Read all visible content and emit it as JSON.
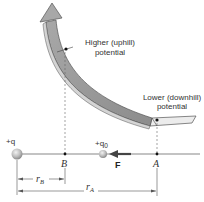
{
  "diagram": {
    "labels": {
      "higher_line1": "Higher (uphill)",
      "higher_line2": "potential",
      "lower_line1": "Lower (downhill)",
      "lower_line2": "potential",
      "source_charge": "+q",
      "test_charge_prefix": "+q",
      "test_charge_sub": "0",
      "point_b": "B",
      "point_a": "A",
      "force": "F",
      "r_b": "r",
      "r_b_sub": "B",
      "r_a": "r",
      "r_a_sub": "A"
    },
    "colors": {
      "ramp_fill": "#9a9a9a",
      "ramp_light": "#e6e6e6",
      "ramp_edge": "#555555",
      "axis": "#555555",
      "force_arrow": "#444444",
      "charge_fill": "#b8b8b8"
    }
  }
}
